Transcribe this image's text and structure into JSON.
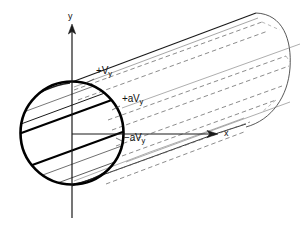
{
  "figure": {
    "type": "technical-diagram",
    "background_color": "#ffffff",
    "line_color": "#000000",
    "dashed_line_color": "#555555",
    "thin_line_color": "#444444"
  },
  "axes": {
    "y": {
      "label": "y",
      "orientation": "vertical",
      "arrow": "up",
      "x_px": 72,
      "top_px": 25,
      "bottom_px": 218
    },
    "x": {
      "label": "x",
      "orientation": "horizontal",
      "arrow": "right",
      "y_px": 134,
      "left_px": 72,
      "right_px": 218
    },
    "origin": {
      "x_px": 72,
      "y_px": 134
    }
  },
  "cross_section": {
    "shape": "circle",
    "center_x_px": 72,
    "center_y_px": 133,
    "radius_px": 52,
    "stroke_width": 2.6
  },
  "cylinder": {
    "orientation": "diagonal-up-right",
    "far_cap": "rounded",
    "far_cap_x_px": 280
  },
  "labels": [
    {
      "id": "plus-vy",
      "prefix": "+V",
      "subscript": "y",
      "text": "+Vy",
      "x_px": 96,
      "y_px": 72
    },
    {
      "id": "plus-a-vy",
      "prefix": "+aV",
      "subscript": "y",
      "text": "+aVy",
      "x_px": 122,
      "y_px": 100
    },
    {
      "id": "minus-a-vy",
      "prefix": "−aV",
      "subscript": "y",
      "text": "−aVy",
      "x_px": 124,
      "y_px": 139
    }
  ]
}
